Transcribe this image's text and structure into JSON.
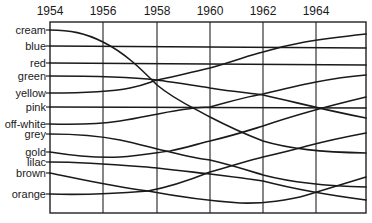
{
  "chart_data": {
    "type": "line",
    "title": "",
    "xlabel": "",
    "ylabel": "",
    "x_ticks": [
      "1954",
      "1956",
      "1958",
      "1960",
      "1962",
      "1964"
    ],
    "x_range": [
      1954,
      1966
    ],
    "grid": "vertical lines at each labelled year",
    "legend": "none; series labelled on left axis",
    "categories": [
      "1954",
      "1956",
      "1958",
      "1960",
      "1962",
      "1964",
      "1966"
    ],
    "series": [
      {
        "name": "cream",
        "values": [
          1,
          1.6,
          3.6,
          6.0,
          7.6,
          8.6,
          9
        ]
      },
      {
        "name": "blue",
        "values": [
          2,
          2,
          2,
          2,
          2,
          2,
          2
        ]
      },
      {
        "name": "red",
        "values": [
          3,
          3,
          3,
          3,
          3,
          3,
          3
        ]
      },
      {
        "name": "green",
        "values": [
          4,
          4.1,
          4.3,
          4.9,
          5.6,
          6.4,
          7
        ]
      },
      {
        "name": "yellow",
        "values": [
          5,
          4.8,
          4.3,
          3.4,
          2.5,
          1.7,
          1
        ]
      },
      {
        "name": "pink",
        "values": [
          6,
          6,
          6,
          6,
          6,
          6,
          6
        ]
      },
      {
        "name": "off-white",
        "values": [
          7,
          7,
          6.5,
          6.0,
          5.3,
          4.5,
          4
        ]
      },
      {
        "name": "grey",
        "values": [
          8,
          8.1,
          8.6,
          9.4,
          10.3,
          10.8,
          11
        ]
      },
      {
        "name": "gold",
        "values": [
          9,
          9.3,
          8.9,
          8.1,
          7.3,
          6.3,
          5
        ]
      },
      {
        "name": "lilac",
        "values": [
          10,
          10,
          10.3,
          10.6,
          11.0,
          11.6,
          12
        ]
      },
      {
        "name": "brown",
        "values": [
          11,
          11.6,
          12.1,
          12.6,
          12.7,
          12.0,
          10
        ]
      },
      {
        "name": "orange",
        "values": [
          12,
          12,
          11.6,
          10.9,
          9.9,
          8.8,
          8
        ]
      }
    ]
  },
  "axis": {
    "years": [
      {
        "label": "1954",
        "x": 50
      },
      {
        "label": "1956",
        "x": 103
      },
      {
        "label": "1958",
        "x": 157
      },
      {
        "label": "1960",
        "x": 210
      },
      {
        "label": "1962",
        "x": 263
      },
      {
        "label": "1964",
        "x": 316
      }
    ]
  },
  "labels": [
    {
      "text": "cream",
      "y": 30
    },
    {
      "text": "blue",
      "y": 46
    },
    {
      "text": "red",
      "y": 63
    },
    {
      "text": "green",
      "y": 76
    },
    {
      "text": "yellow",
      "y": 93
    },
    {
      "text": "pink",
      "y": 107
    },
    {
      "text": "off-white",
      "y": 124
    },
    {
      "text": "grey",
      "y": 134
    },
    {
      "text": "gold",
      "y": 152
    },
    {
      "text": "lilac",
      "y": 162
    },
    {
      "text": "brown",
      "y": 173
    },
    {
      "text": "orange",
      "y": 194
    }
  ],
  "paths": [
    {
      "name": "cream",
      "d": "M50,30 C70,30 85,33 103,42 C125,53 140,68 157,85 C175,100 190,106 210,117 C235,130 250,136 263,141 C290,149 320,152 366,153"
    },
    {
      "name": "blue",
      "d": "M50,46 L366,48"
    },
    {
      "name": "red",
      "d": "M50,63 L366,65"
    },
    {
      "name": "green",
      "d": "M50,76 C90,76 130,77 157,80 C185,84 200,86 210,88 C235,92 250,93 263,95 C295,102 320,109 366,118"
    },
    {
      "name": "yellow",
      "d": "M50,93 C85,93 110,92 130,88 C145,85 150,82 157,80 C180,76 195,71 210,68 C235,61 250,55 263,52 C290,44 310,40 366,34"
    },
    {
      "name": "pink",
      "d": "M50,107 L366,108"
    },
    {
      "name": "off-white",
      "d": "M50,124 C80,125 100,124 120,121 C140,118 160,113 180,110 C195,108 200,107 210,107 C235,100 250,96 263,94 C300,85 330,78 366,75"
    },
    {
      "name": "grey",
      "d": "M50,134 C80,134 100,136 120,140 C140,144 155,149 170,152 C190,157 200,159 210,160 C235,166 250,171 263,175 C290,182 320,186 366,187"
    },
    {
      "name": "gold",
      "d": "M50,152 C75,156 100,158 120,157 C140,156 160,152 170,151 C190,147 200,143 210,141 C235,135 250,130 263,126 C295,115 320,108 366,97"
    },
    {
      "name": "lilac",
      "d": "M50,162 C90,162 120,165 157,168 C185,171 200,173 210,174 C235,177 250,179 263,181 C290,188 320,194 366,200"
    },
    {
      "name": "brown",
      "d": "M50,173 C80,179 110,186 148,191 C180,197 210,201 240,203 C263,204 290,200 307,195 C330,188 350,182 366,177"
    },
    {
      "name": "orange",
      "d": "M50,194 C80,195 110,194 148,191 C175,186 195,178 210,172 C235,165 250,160 263,157 C285,152 300,148 307,146 C330,140 350,136 366,133"
    }
  ]
}
